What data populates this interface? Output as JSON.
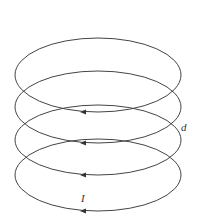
{
  "diagram": {
    "loops": [
      {
        "cx": 98,
        "cy": 75,
        "rx": 83,
        "ry": 37
      },
      {
        "cx": 98,
        "cy": 107,
        "rx": 83,
        "ry": 36
      },
      {
        "cx": 98,
        "cy": 140,
        "rx": 83,
        "ry": 35
      },
      {
        "cx": 98,
        "cy": 175,
        "rx": 83,
        "ry": 36
      }
    ],
    "labels": {
      "spacing": "d",
      "current": "I"
    },
    "stroke_color": "#444444"
  }
}
